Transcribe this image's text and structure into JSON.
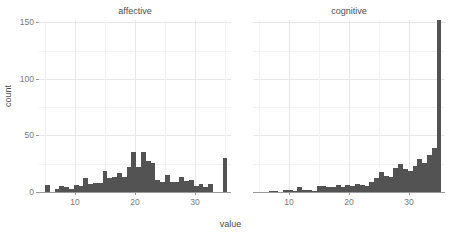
{
  "chart_data": {
    "type": "bar",
    "title": "",
    "xlabel": "value",
    "ylabel": "count",
    "facet_variable": "condition",
    "facets": [
      "affective",
      "cognitive"
    ],
    "xlim": [
      4,
      36
    ],
    "ylim": [
      0,
      152
    ],
    "x_ticks": [
      10,
      20,
      30
    ],
    "y_ticks": [
      0,
      50,
      100,
      150
    ],
    "y_minor_ticks": [
      25,
      75,
      125
    ],
    "x_minor_ticks": [
      5,
      15,
      25,
      35
    ],
    "grid": true,
    "legend": "none",
    "bin_width": 0.8,
    "bar_color": "#535353",
    "panels": [
      {
        "name": "affective",
        "bin_centers": [
          5.4,
          6.2,
          7.0,
          7.8,
          8.6,
          9.4,
          10.2,
          11.0,
          11.8,
          12.6,
          13.4,
          14.2,
          15.0,
          15.8,
          16.6,
          17.4,
          18.2,
          19.0,
          19.8,
          20.6,
          21.4,
          22.2,
          23.0,
          23.8,
          24.6,
          25.4,
          26.2,
          27.0,
          27.8,
          28.6,
          29.4,
          30.2,
          31.0,
          31.8,
          32.6,
          33.4,
          34.2,
          35.0
        ],
        "counts": [
          6,
          0,
          3,
          5,
          4,
          3,
          6,
          5,
          12,
          7,
          8,
          8,
          19,
          12,
          13,
          17,
          13,
          22,
          35,
          22,
          35,
          27,
          26,
          11,
          9,
          15,
          9,
          9,
          13,
          10,
          11,
          5,
          7,
          4,
          7,
          0,
          0,
          30
        ]
      },
      {
        "name": "cognitive",
        "bin_centers": [
          5.4,
          6.2,
          7.0,
          7.8,
          8.6,
          9.4,
          10.2,
          11.0,
          11.8,
          12.6,
          13.4,
          14.2,
          15.0,
          15.8,
          16.6,
          17.4,
          18.2,
          19.0,
          19.8,
          20.6,
          21.4,
          22.2,
          23.0,
          23.8,
          24.6,
          25.4,
          26.2,
          27.0,
          27.8,
          28.6,
          29.4,
          30.2,
          31.0,
          31.8,
          32.6,
          33.4,
          34.2,
          35.0
        ],
        "counts": [
          0,
          0,
          1,
          1,
          0,
          2,
          2,
          1,
          4,
          2,
          2,
          1,
          5,
          5,
          4,
          4,
          6,
          4,
          6,
          5,
          7,
          6,
          5,
          9,
          12,
          18,
          14,
          13,
          21,
          25,
          20,
          19,
          23,
          29,
          26,
          33,
          39,
          152
        ]
      }
    ]
  },
  "axes": {
    "y_title": "count",
    "x_title": "value",
    "y_tick_labels": [
      "0",
      "50",
      "100",
      "150"
    ],
    "x_tick_labels": [
      "10",
      "20",
      "30"
    ]
  },
  "panel_titles": {
    "left": "affective",
    "right": "cognitive"
  }
}
